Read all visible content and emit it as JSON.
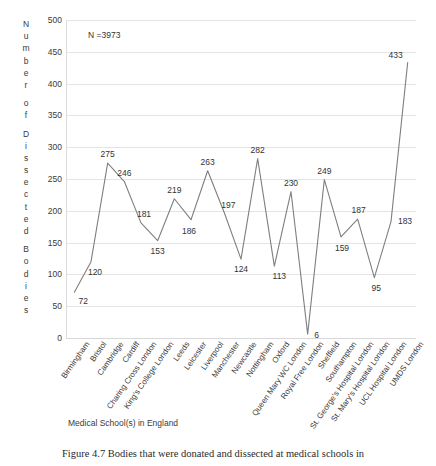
{
  "chart_data": {
    "type": "line",
    "title": "",
    "annotation": "N =3973",
    "xlabel": "Medical School(s) in England",
    "ylabel": "Number of Dissected Bodies",
    "ylim": [
      0,
      500
    ],
    "ytick_step": 50,
    "yticks": [
      "500",
      "450",
      "400",
      "350",
      "300",
      "250",
      "200",
      "150",
      "100",
      "50",
      "0"
    ],
    "grid": true,
    "legend": "none",
    "line_color": "#7f7f7f",
    "categories": [
      "Birmingham",
      "Bristol",
      "Cambridge",
      "Cardiff",
      "Charing Cross London",
      "King's College London",
      "Leeds",
      "Leicester",
      "Liverpool",
      "Manchester",
      "Newcastle",
      "Nottingham",
      "Oxford",
      "Queen Mary WC London",
      "Royal Free London",
      "Sheffield",
      "Southampton",
      "St. George's Hospital London",
      "St. Mary's Hospital London",
      "UCL Hospital London",
      "UMDS London"
    ],
    "values": [
      72,
      120,
      275,
      246,
      181,
      153,
      219,
      186,
      263,
      197,
      124,
      282,
      113,
      230,
      6,
      249,
      159,
      187,
      95,
      183,
      433
    ],
    "point_labels": [
      "72",
      "120",
      "275",
      "246",
      "181",
      "153",
      "219",
      "186",
      "263",
      "197",
      "124",
      "282",
      "113",
      "230",
      "6",
      "249",
      "159",
      "187",
      "95",
      "183",
      "433"
    ]
  },
  "ylabel_letters": [
    "N",
    "u",
    "m",
    "b",
    "e",
    "r",
    "",
    "o",
    "f",
    "",
    "D",
    "i",
    "s",
    "s",
    "e",
    "c",
    "t",
    "e",
    "d",
    "",
    "B",
    "o",
    "d",
    "i",
    "e",
    "s"
  ],
  "caption": {
    "text": "Figure 4.7  Bodies that were donated and dissected at medical schools in"
  }
}
